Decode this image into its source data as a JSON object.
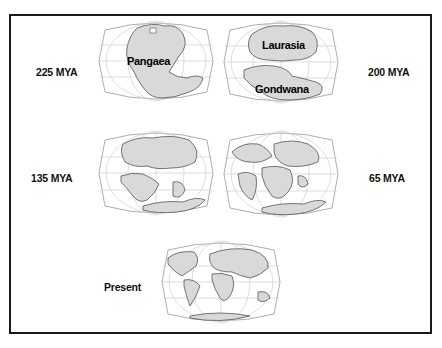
{
  "figure": {
    "panels": [
      {
        "id": "225",
        "era_label": "225 MYA",
        "map_labels": [
          "Pangaea"
        ]
      },
      {
        "id": "200",
        "era_label": "200 MYA",
        "map_labels": [
          "Laurasia",
          "Gondwana"
        ]
      },
      {
        "id": "135",
        "era_label": "135 MYA",
        "map_labels": []
      },
      {
        "id": "65",
        "era_label": "65 MYA",
        "map_labels": []
      },
      {
        "id": "present",
        "era_label": "Present",
        "map_labels": []
      }
    ]
  },
  "colors": {
    "land": "#d9d9d9",
    "coast": "#555555",
    "grid": "#bdbdbd",
    "frame": "#1a1a1a",
    "text": "#111111"
  }
}
